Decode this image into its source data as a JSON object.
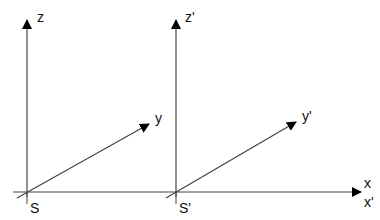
{
  "diagram": {
    "frame_S": {
      "origin_label": "S",
      "axes": {
        "z": "z",
        "y": "y"
      }
    },
    "frame_S_prime": {
      "origin_label": "S'",
      "axes": {
        "z": "z'",
        "y": "y'"
      }
    },
    "shared_axis": {
      "x": "x",
      "x_prime": "x'"
    },
    "colors": {
      "line": "#444444",
      "arrow": "#000000",
      "text": "#111111"
    }
  }
}
